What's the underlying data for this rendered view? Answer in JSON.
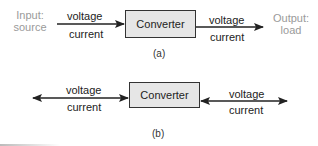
{
  "diagram_a": {
    "input_label_line1": "Input:",
    "input_label_line2": "source",
    "left_top": "voltage",
    "left_bottom": "current",
    "box_label": "Converter",
    "right_top": "voltage",
    "right_bottom": "current",
    "output_label_line1": "Output:",
    "output_label_line2": "load",
    "caption": "(a)"
  },
  "diagram_b": {
    "left_top": "voltage",
    "left_bottom": "current",
    "box_label": "Converter",
    "right_top": "voltage",
    "right_bottom": "current",
    "caption": "(b)"
  },
  "colors": {
    "box_fill": "#e6e6e6",
    "line": "#222222",
    "faint_text": "#9a9a9a"
  }
}
